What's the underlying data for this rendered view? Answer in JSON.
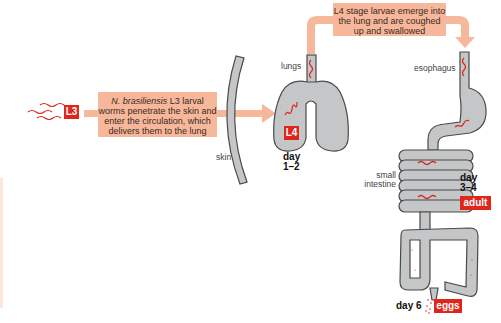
{
  "colors": {
    "arrow_fill": "#f7b79a",
    "tag_red": "#e0261b",
    "organ_gray": "#c5c6c8",
    "organ_outline": "#4a4a4a",
    "worm_red": "#d9261c"
  },
  "stages": {
    "l3": "L3",
    "l4": "L4",
    "adult": "adult",
    "eggs": "eggs"
  },
  "notes": {
    "skin_entry_italic": "N. brasiliensis",
    "skin_entry_rest": " L3 larval worms penetrate the skin and enter the circulation, which delivers them to the lung",
    "lung_exit": "L4 stage larvae emerge into the lung and are coughed up and swallowed"
  },
  "labels": {
    "skin": "skin",
    "lungs": "lungs",
    "esophagus": "esophagus",
    "small_intestine_line1": "small",
    "small_intestine_line2": "intestine"
  },
  "days": {
    "lung_line1": "day",
    "lung_line2": "1–2",
    "intestine_line1": "day",
    "intestine_line2": "3–4",
    "eggs": "day 6"
  }
}
